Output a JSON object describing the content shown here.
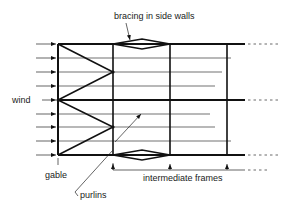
{
  "diagram": {
    "labels": {
      "bracing": "bracing in side walls",
      "wind": "wind",
      "gable": "gable",
      "purlins": "purlins",
      "intermediate_frames": "intermediate frames"
    },
    "colors": {
      "line": "#111111",
      "background": "#ffffff"
    }
  }
}
